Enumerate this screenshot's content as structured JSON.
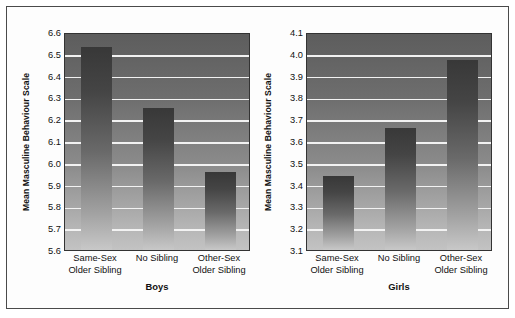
{
  "figure": {
    "frame_color": "#4a4a4a",
    "background": "#ffffff"
  },
  "chart_data": [
    {
      "type": "bar",
      "title": "Boys",
      "xlabel": "Boys",
      "ylabel": "Mean Masculine Behaviour Scale",
      "categories": [
        "Same-Sex\nOlder Sibling",
        "No Sibling",
        "Other-Sex\nOlder Sibling"
      ],
      "category_lines": [
        [
          "Same-Sex",
          "Older Sibling"
        ],
        [
          "No Sibling",
          ""
        ],
        [
          "Other-Sex",
          "Older Sibling"
        ]
      ],
      "values": [
        6.53,
        6.25,
        5.96
      ],
      "ylim": [
        5.6,
        6.6
      ],
      "yticks": [
        5.6,
        5.7,
        5.8,
        5.9,
        6.0,
        6.1,
        6.2,
        6.3,
        6.4,
        6.5,
        6.6
      ],
      "ytick_labels": [
        "5.6",
        "5.7",
        "5.8",
        "5.9",
        "6.0",
        "6.1",
        "6.2",
        "6.3",
        "6.4",
        "6.5",
        "6.6"
      ],
      "gridlines_at": [
        5.7,
        5.8,
        5.9,
        6.0,
        6.1,
        6.2,
        6.3,
        6.4,
        6.5
      ],
      "grid": true,
      "legend": "none"
    },
    {
      "type": "bar",
      "title": "Girls",
      "xlabel": "Girls",
      "ylabel": "Mean Masculine Behaviour Scale",
      "categories": [
        "Same-Sex\nOlder Sibling",
        "No Sibling",
        "Other-Sex\nOlder Sibling"
      ],
      "category_lines": [
        [
          "Same-Sex",
          "Older Sibling"
        ],
        [
          "No Sibling",
          ""
        ],
        [
          "Other-Sex",
          "Older Sibling"
        ]
      ],
      "values": [
        3.44,
        3.66,
        3.97
      ],
      "ylim": [
        3.1,
        4.1
      ],
      "yticks": [
        3.1,
        3.2,
        3.3,
        3.4,
        3.5,
        3.6,
        3.7,
        3.8,
        3.9,
        4.0,
        4.1
      ],
      "ytick_labels": [
        "3.1",
        "3.2",
        "3.3",
        "3.4",
        "3.5",
        "3.6",
        "3.7",
        "3.8",
        "3.9",
        "4.0",
        "4.1"
      ],
      "gridlines_at": [
        3.2,
        3.3,
        3.4,
        3.5,
        3.6,
        3.7,
        3.8,
        3.9,
        4.0
      ],
      "grid": true,
      "legend": "none"
    }
  ]
}
